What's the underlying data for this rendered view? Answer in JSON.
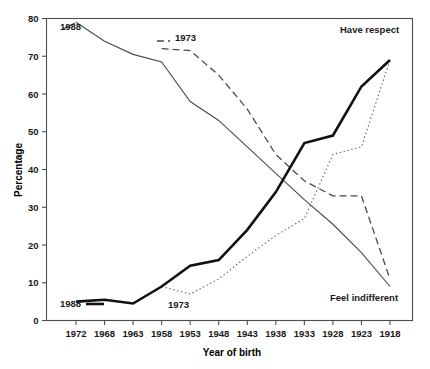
{
  "chart_data": {
    "type": "line",
    "title": "",
    "xlabel": "Year of birth",
    "ylabel": "Percentage",
    "xlim": [
      1972,
      1918
    ],
    "ylim": [
      0,
      80
    ],
    "yticks": [
      0,
      10,
      20,
      30,
      40,
      50,
      60,
      70,
      80
    ],
    "xticks": [
      1972,
      1968,
      1963,
      1958,
      1953,
      1948,
      1943,
      1938,
      1933,
      1928,
      1923,
      1918
    ],
    "grid": false,
    "legend_position": "inline-annotations",
    "x": [
      1972,
      1968,
      1963,
      1958,
      1953,
      1948,
      1943,
      1938,
      1933,
      1928,
      1923,
      1918
    ],
    "series": [
      {
        "name": "Feel indifferent 1988",
        "style": "solid-thin",
        "annotation": "1988",
        "end_annotation": "Feel indifferent",
        "values": [
          79,
          74,
          70.5,
          68.5,
          58,
          53,
          46,
          39,
          32,
          25.5,
          18,
          9
        ]
      },
      {
        "name": "Feel indifferent 1973",
        "style": "dashed",
        "annotation": "1973",
        "values": [
          null,
          null,
          null,
          72,
          71.5,
          65,
          56,
          44,
          37,
          33,
          33,
          11
        ]
      },
      {
        "name": "Have respect 1988",
        "style": "solid-thick",
        "annotation": "1988",
        "end_annotation": "Have respect",
        "values": [
          5,
          5.5,
          4.5,
          9,
          14.5,
          16,
          24,
          34,
          47,
          49,
          62,
          69
        ]
      },
      {
        "name": "Have respect 1973",
        "style": "dotted",
        "annotation": "1973",
        "values": [
          null,
          null,
          null,
          9,
          7,
          11,
          17,
          22.5,
          27,
          44,
          46,
          69
        ]
      }
    ],
    "annotations": [
      {
        "text": "1988",
        "series": "Feel indifferent 1988",
        "position": "top-left"
      },
      {
        "text": "1973",
        "series": "Feel indifferent 1973",
        "position": "top-middle"
      },
      {
        "text": "1988",
        "series": "Have respect 1988",
        "position": "bottom-left"
      },
      {
        "text": "1973",
        "series": "Have respect 1973",
        "position": "bottom-middle"
      },
      {
        "text": "Have respect",
        "series": "Have respect 1988",
        "position": "top-right"
      },
      {
        "text": "Feel indifferent",
        "series": "Feel indifferent 1988",
        "position": "bottom-right"
      }
    ]
  },
  "labels": {
    "y_axis_title": "Percentage",
    "x_axis_title": "Year of birth",
    "yticks": [
      "80",
      "70",
      "60",
      "50",
      "40",
      "30",
      "20",
      "10",
      "0"
    ],
    "xticks": [
      "1972",
      "1968",
      "1963",
      "1958",
      "1953",
      "1948",
      "1943",
      "1938",
      "1933",
      "1928",
      "1923",
      "1918"
    ],
    "anno_1988_top": "1988",
    "anno_1973_top": "1973",
    "anno_1988_bottom": "1988",
    "anno_1973_bottom": "1973",
    "anno_have_respect": "Have respect",
    "anno_feel_indifferent": "Feel indifferent"
  },
  "colors": {
    "axis": "#4d4d4d",
    "thin_line": "#4a4a4a",
    "thick_line": "#111111",
    "dashed_line": "#4a4a4a",
    "dotted_line": "#6a6a6a",
    "text": "#1a1a1a",
    "background": "#ffffff"
  }
}
